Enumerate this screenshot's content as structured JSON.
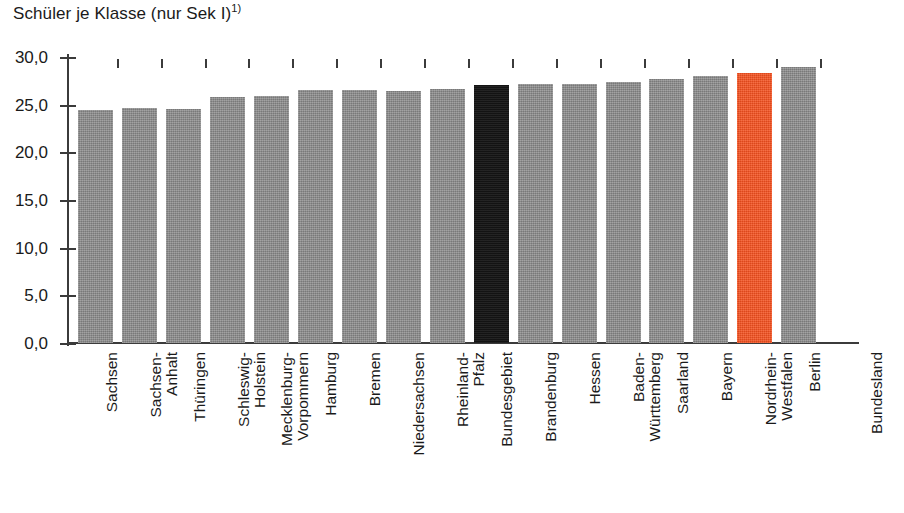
{
  "chart_data": {
    "type": "bar",
    "title": "Schüler je Klasse (nur Sek I)",
    "title_footnote": "1)",
    "xlabel": "Bundesland",
    "ylabel": "",
    "ylim": [
      0,
      30
    ],
    "ytick_labels": [
      "0,0",
      "5,0",
      "10,0",
      "15,0",
      "20,0",
      "25,0",
      "30,0"
    ],
    "ytick_values": [
      0,
      5,
      10,
      15,
      20,
      25,
      30
    ],
    "grid": false,
    "legend": "none",
    "categories": [
      "Sachsen",
      "Sachsen-\nAnhalt",
      "Thüringen",
      "Schleswig-\nHolstein",
      "Mecklenburg-\nVorpommern",
      "Hamburg",
      "Bremen",
      "Niedersachsen",
      "Rheinland-\nPfalz",
      "Bundesgebiet",
      "Brandenburg",
      "Hessen",
      "Baden-\nWürttemberg",
      "Saarland",
      "Bayern",
      "Nordrhein-\nWestfalen",
      "Berlin"
    ],
    "values": [
      24.4,
      24.6,
      24.5,
      25.8,
      25.9,
      26.5,
      26.5,
      26.4,
      26.6,
      27.1,
      27.2,
      27.2,
      27.4,
      27.7,
      28.0,
      28.3,
      29.0
    ],
    "series": [
      {
        "name": "Schüler je Klasse (nur Sek I)",
        "values": [
          24.4,
          24.6,
          24.5,
          25.8,
          25.9,
          26.5,
          26.5,
          26.4,
          26.6,
          27.1,
          27.2,
          27.2,
          27.4,
          27.7,
          28.0,
          28.3,
          29.0
        ]
      }
    ],
    "bar_colors": [
      "#8a8a8a",
      "#8a8a8a",
      "#8a8a8a",
      "#8a8a8a",
      "#8a8a8a",
      "#8a8a8a",
      "#8a8a8a",
      "#8a8a8a",
      "#8a8a8a",
      "#161616",
      "#8a8a8a",
      "#8a8a8a",
      "#8a8a8a",
      "#8a8a8a",
      "#8a8a8a",
      "#f4501e",
      "#8a8a8a"
    ],
    "colors": {
      "bar_default": "#8a8a8a",
      "bar_total": "#161616",
      "bar_highlight": "#f4501e",
      "axis": "#3b3b3b",
      "text": "#1a1a1a",
      "background": "#ffffff"
    }
  }
}
